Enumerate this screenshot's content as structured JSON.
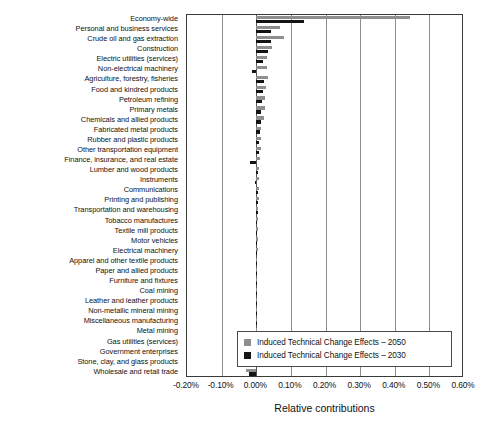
{
  "chart_data": {
    "type": "bar",
    "orientation": "horizontal",
    "title": "",
    "xlabel": "Relative contributions",
    "ylabel": "",
    "xlim": [
      -0.2,
      0.6
    ],
    "xticks": [
      "-0.20%",
      "-0.10%",
      "0.00%",
      "0.10%",
      "0.20%",
      "0.30%",
      "0.40%",
      "0.50%",
      "0.60%"
    ],
    "xtick_values": [
      -0.2,
      -0.1,
      0.0,
      0.1,
      0.2,
      0.3,
      0.4,
      0.5,
      0.6
    ],
    "grid": true,
    "legend_position": "bottom-right",
    "categories": [
      "Economy-wide",
      "Personal and business services",
      "Crude oil and gas extraction",
      "Construction",
      "Electric utilities (services)",
      "Non-electrical machinery",
      "Agriculture, forestry, fisheries",
      "Food and kindred products",
      "Petroleum refining",
      "Primary metals",
      "Chemicals and allied products",
      "Fabricated metal products",
      "Rubber and plastic products",
      "Other transportation equipment",
      "Finance, insurance, and real estate",
      "Lumber and wood products",
      "Instruments",
      "Communications",
      "Printing and publishing",
      "Transportation and warehousing",
      "Tobacco manufactures",
      "Textile mill products",
      "Motor vehicles",
      "Electrical machinery",
      "Apparel and other textile products",
      "Paper and allied products",
      "Furniture and fixtures",
      "Coal mining",
      "Leather and leather products",
      "Non-metallic mineral mining",
      "Miscellaneous manufacturing",
      "Metal mining",
      "Gas utilities (services)",
      "Government enterprises",
      "Stone, clay, and glass products",
      "Wholesale and retail trade"
    ],
    "series": [
      {
        "name": "Induced Technical Change Effects – 2050",
        "color": "#8e8e8e",
        "values": [
          0.445,
          0.068,
          0.081,
          0.046,
          0.03,
          0.03,
          0.034,
          0.029,
          0.026,
          0.024,
          0.021,
          0.015,
          0.014,
          0.013,
          0.012,
          0.009,
          0.008,
          0.008,
          0.007,
          0.006,
          0.005,
          0.005,
          0.004,
          0.004,
          0.003,
          0.003,
          0.003,
          0.002,
          0.002,
          0.002,
          0.001,
          0.001,
          -0.004,
          -0.01,
          -0.016,
          -0.03
        ]
      },
      {
        "name": "Induced Technical Change Effects – 2030",
        "color": "#141414",
        "values": [
          0.138,
          0.042,
          0.043,
          0.033,
          0.02,
          -0.012,
          0.021,
          0.019,
          0.017,
          0.015,
          0.013,
          0.01,
          0.009,
          0.008,
          -0.019,
          0.006,
          -0.005,
          0.005,
          0.004,
          0.004,
          0.003,
          0.003,
          0.003,
          0.002,
          0.002,
          0.002,
          0.002,
          0.001,
          0.001,
          0.001,
          0.001,
          0.001,
          -0.003,
          -0.007,
          -0.022,
          -0.021
        ]
      }
    ]
  },
  "legend": {
    "items": [
      {
        "label": "Induced Technical Change Effects – 2050",
        "color": "#8e8e8e"
      },
      {
        "label": "Induced Technical Change Effects – 2030",
        "color": "#141414"
      }
    ]
  }
}
